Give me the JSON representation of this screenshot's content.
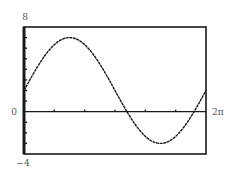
{
  "chart_data": {
    "type": "line",
    "title": "",
    "xlabel": "",
    "ylabel": "",
    "function": "2 + 5*sin(x)",
    "xlim": [
      0,
      6.283185307
    ],
    "ylim": [
      -4,
      8
    ],
    "x_tick_step": "pi/3",
    "y_tick_step": 1,
    "tick_labels": {
      "y_top": "8",
      "y_bottom": "−4",
      "y_zero": "0",
      "x_right": "2π"
    },
    "series": [
      {
        "name": "f(x)",
        "x": [
          0,
          0.5236,
          1.0472,
          1.5708,
          2.0944,
          2.618,
          3.1416,
          3.6652,
          4.1888,
          4.7124,
          5.236,
          5.7596,
          6.2832
        ],
        "values": [
          2,
          4.5,
          6.33,
          7,
          6.33,
          4.5,
          2,
          -0.5,
          -2.33,
          -3,
          -2.33,
          -0.5,
          2
        ]
      }
    ],
    "grid": false,
    "legend": "none",
    "colors": {
      "curve": "#1a1a1a",
      "frame": "#1a1a1a",
      "label": "#555555"
    }
  }
}
